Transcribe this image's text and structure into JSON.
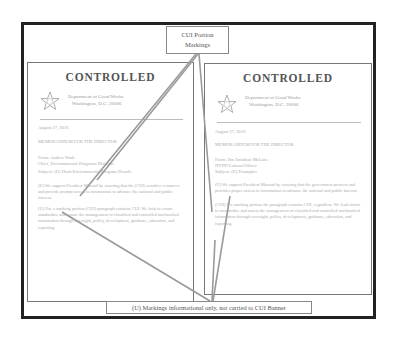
{
  "callouts": {
    "top": {
      "line1": "CUI Portion",
      "line2": "Markings"
    },
    "bottom": "(U) Markings informational only, not carried to CUI Banner"
  },
  "documents": [
    {
      "banner": "CONTROLLED",
      "seal_icon": "star-seal-icon",
      "dept_line1": "Department of Good Works",
      "dept_line2": "Washington, D.C. 20006",
      "date": "August 27, 2016",
      "memo_for": "MEMORANDUM FOR THE DIRECTOR",
      "from_line1": "From: Andrea Wade",
      "from_line2": "Chief, Environmental Programs Division",
      "subject": "Subject: (U) Draft Environmental Program Details",
      "para1": "(U) We support President Masond by ensuring that the (CUI) sensitive resources and provide prompt access to information to advance the national and public interest.",
      "para2": "(U) Use a marking portion (CUI) paragraph contains CUI. We look to ensure standardize and ensure the management of classified and controlled unclassified information through oversight, policy, development, guidance, education, and reporting."
    },
    {
      "banner": "CONTROLLED",
      "seal_icon": "star-seal-icon",
      "dept_line1": "Department of Good Works",
      "dept_line2": "Washington, D.C. 20006",
      "date": "August 27, 2016",
      "memo_for": "MEMORANDUM FOR THE DIRECTOR",
      "from_line1": "From: Jim Jonathan McLain",
      "from_line2": "NYPD Liaison Officer",
      "subject": "Subject: (U) Examples",
      "para1": "(U) We support President Masond by ensuring that the government protects and provides proper access to information to advance the national and public interest.",
      "para2": "(CUI) If a marking portion the paragraph contains CUI, regardless. We lead efforts to standardize and assess the management of classified and controlled unclassified information through oversight, policy, development, guidance, education, and reporting."
    }
  ],
  "colors": {
    "frame": "#222222",
    "doc_border": "#777777",
    "arrow": "#999999",
    "text": "#555555"
  }
}
